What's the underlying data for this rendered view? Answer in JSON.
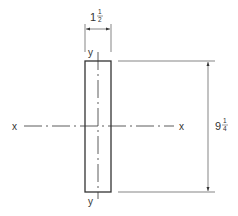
{
  "diagram": {
    "type": "cross-section",
    "shape": "rectangle",
    "axes": {
      "x_axis": {
        "left_label": "x",
        "right_label": "x"
      },
      "y_axis": {
        "top_label": "y",
        "bottom_label": "y"
      }
    },
    "dimensions": {
      "width": {
        "whole": "1",
        "num": "1",
        "den": "2",
        "value": "1 1/2"
      },
      "height": {
        "whole": "9",
        "num": "1",
        "den": "4",
        "value": "9 1/4"
      }
    },
    "colors": {
      "line": "#333333",
      "background": "#ffffff"
    }
  }
}
